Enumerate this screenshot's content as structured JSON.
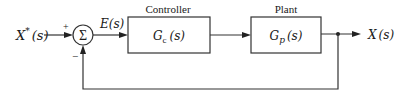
{
  "diagram": {
    "type": "feedback-control-block-diagram",
    "input": {
      "label": "X",
      "superscript": "*",
      "arg": "(s)"
    },
    "summing_junction": {
      "symbol": "Σ",
      "plus_sign": "+",
      "minus_sign": "−"
    },
    "error_signal": {
      "label": "E(s)"
    },
    "controller": {
      "title": "Controller",
      "tf_main": "G",
      "tf_sub": "c",
      "tf_arg": "(s)"
    },
    "plant": {
      "title": "Plant",
      "tf_main": "G",
      "tf_sub": "p",
      "tf_arg": "(s)"
    },
    "output": {
      "label": "X",
      "arg": "(s)"
    },
    "feedback": {
      "type": "unity negative feedback"
    }
  },
  "colors": {
    "line": "#333333",
    "text": "#1a1a1a",
    "background": "#ffffff"
  }
}
